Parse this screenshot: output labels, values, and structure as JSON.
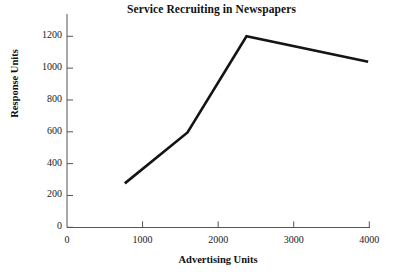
{
  "chart_data": {
    "type": "line",
    "title": "Service Recruiting in Newspapers",
    "xlabel": "Advertising Units",
    "ylabel": "Response Units",
    "xlim": [
      0,
      4000
    ],
    "ylim": [
      0,
      1300
    ],
    "grid": false,
    "legend": null,
    "xticks": [
      0,
      1000,
      2000,
      3000,
      4000
    ],
    "xtick_labels": [
      "0",
      "1000",
      "2000",
      "3000",
      "4000"
    ],
    "yticks": [
      0,
      200,
      400,
      600,
      800,
      1000,
      1200
    ],
    "ytick_labels": [
      "0",
      "200",
      "400",
      "600",
      "800",
      "1000",
      "1200"
    ],
    "series": [
      {
        "name": "Response",
        "color": "#141414",
        "x": [
          765,
          1595,
          2375,
          3985
        ],
        "y": [
          276,
          596,
          1200,
          1040
        ],
        "points": [
          {
            "x": 765,
            "y": 276
          },
          {
            "x": 1595,
            "y": 596
          },
          {
            "x": 2375,
            "y": 1200
          },
          {
            "x": 3985,
            "y": 1040
          }
        ]
      }
    ]
  }
}
